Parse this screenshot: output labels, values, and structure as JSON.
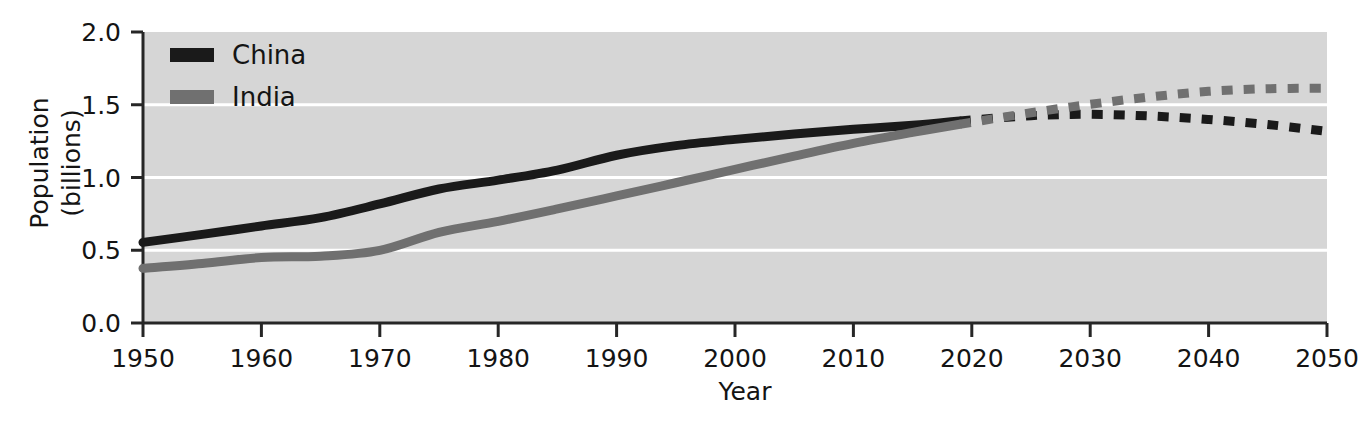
{
  "chart_data": {
    "type": "line",
    "title": "",
    "subtitle": "",
    "xlabel": "Year",
    "ylabel": "Population\n(billions)",
    "ylabel_line1": "Population",
    "ylabel_line2": "(billions)",
    "xlim": [
      1950,
      2050
    ],
    "ylim": [
      0.0,
      2.0
    ],
    "xticks": [
      1950,
      1960,
      1970,
      1980,
      1990,
      2000,
      2010,
      2020,
      2030,
      2040,
      2050
    ],
    "xtick_labels": [
      "1950",
      "1960",
      "1970",
      "1980",
      "1990",
      "2000",
      "2010",
      "2020",
      "2030",
      "2040",
      "2050"
    ],
    "yticks": [
      0.0,
      0.5,
      1.0,
      1.5,
      2.0
    ],
    "ytick_labels": [
      "0.0",
      "0.5",
      "1.0",
      "1.5",
      "2.0"
    ],
    "grid": true,
    "gridlines_y": [
      0.5,
      1.0,
      1.5
    ],
    "grid_color": "#ffffff",
    "plot_background": "#d6d6d6",
    "figure_background": "#ffffff",
    "legend_position": "top-left",
    "projection_start_year": 2019,
    "projection_note": "dashed segments are projections",
    "series": [
      {
        "name": "China",
        "color": "#1a1a1a",
        "historical": {
          "x": [
            1950,
            1955,
            1960,
            1965,
            1970,
            1975,
            1980,
            1985,
            1990,
            1995,
            2000,
            2005,
            2010,
            2015,
            2019
          ],
          "y": [
            0.554,
            0.609,
            0.667,
            0.724,
            0.818,
            0.921,
            0.982,
            1.051,
            1.153,
            1.219,
            1.262,
            1.299,
            1.331,
            1.359,
            1.389
          ]
        },
        "projected": {
          "x": [
            2019,
            2025,
            2030,
            2035,
            2040,
            2045,
            2050
          ],
          "y": [
            1.389,
            1.425,
            1.434,
            1.423,
            1.399,
            1.364,
            1.317
          ]
        }
      },
      {
        "name": "India",
        "color": "#707070",
        "historical": {
          "x": [
            1950,
            1955,
            1960,
            1965,
            1970,
            1975,
            1980,
            1985,
            1990,
            1995,
            2000,
            2005,
            2010,
            2015,
            2019
          ],
          "y": [
            0.376,
            0.409,
            0.45,
            0.459,
            0.499,
            0.623,
            0.699,
            0.784,
            0.873,
            0.964,
            1.056,
            1.147,
            1.234,
            1.31,
            1.366
          ]
        },
        "projected": {
          "x": [
            2019,
            2025,
            2030,
            2035,
            2040,
            2045,
            2050
          ],
          "y": [
            1.366,
            1.445,
            1.503,
            1.553,
            1.592,
            1.61,
            1.613
          ]
        }
      }
    ],
    "legend": [
      {
        "label": "China",
        "color": "#1a1a1a",
        "swatch": "thick-line-swatch"
      },
      {
        "label": "India",
        "color": "#707070",
        "swatch": "thick-line-swatch"
      }
    ]
  }
}
